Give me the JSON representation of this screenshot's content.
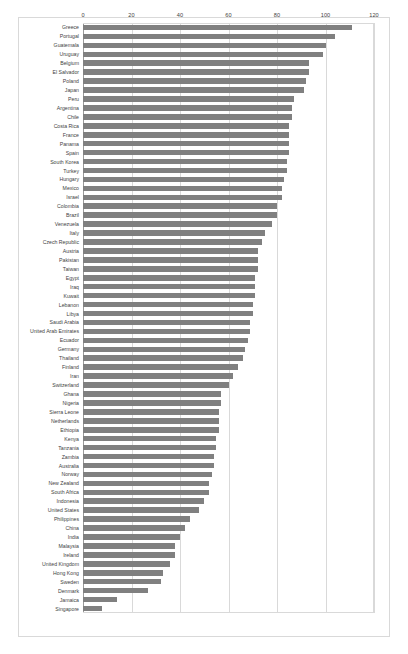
{
  "chart_data": {
    "type": "bar",
    "orientation": "horizontal",
    "title": "",
    "subtitle": "",
    "xlabel": "",
    "ylabel": "",
    "xlim": [
      0,
      120
    ],
    "ylim": null,
    "grid": true,
    "gridline_axis": "x",
    "legend": null,
    "legend_position": "none",
    "bar_color": "#808080",
    "axis_tick_labels": [
      "0",
      "20",
      "40",
      "60",
      "80",
      "100",
      "120"
    ],
    "axis_ticks": [
      0,
      20,
      40,
      60,
      80,
      100,
      120
    ],
    "categories": [
      "Greece",
      "Portugal",
      "Guatemala",
      "Uruguay",
      "Belgium",
      "El Salvador",
      "Poland",
      "Japan",
      "Peru",
      "Argentina",
      "Chile",
      "Costa Rica",
      "France",
      "Panama",
      "Spain",
      "South Korea",
      "Turkey",
      "Hungary",
      "Mexico",
      "Israel",
      "Colombia",
      "Brazil",
      "Venezuela",
      "Italy",
      "Czech Republic",
      "Austria",
      "Pakistan",
      "Taiwan",
      "Egypt",
      "Iraq",
      "Kuwait",
      "Lebanon",
      "Libya",
      "Saudi Arabia",
      "United Arab Emirates",
      "Ecuador",
      "Germany",
      "Thailand",
      "Finland",
      "Iran",
      "Switzerland",
      "Ghana",
      "Nigeria",
      "Sierra Leone",
      "Netherlands",
      "Ethiopia",
      "Kenya",
      "Tanzania",
      "Zambia",
      "Australia",
      "Norway",
      "New Zealand",
      "South Africa",
      "Indonesia",
      "United States",
      "Philippines",
      "China",
      "India",
      "Malaysia",
      "Ireland",
      "United Kingdom",
      "Hong Kong",
      "Sweden",
      "Denmark",
      "Jamaica",
      "Singapore"
    ],
    "values": [
      111,
      104,
      100,
      99,
      93,
      93,
      92,
      91,
      87,
      86,
      86,
      85,
      85,
      85,
      85,
      84,
      84,
      83,
      82,
      82,
      80,
      80,
      78,
      75,
      74,
      72,
      72,
      72,
      71,
      71,
      71,
      70,
      70,
      69,
      69,
      68,
      67,
      66,
      64,
      62,
      60,
      57,
      57,
      56,
      56,
      56,
      55,
      55,
      54,
      54,
      53,
      52,
      52,
      50,
      48,
      44,
      42,
      40,
      38,
      38,
      36,
      33,
      32,
      27,
      14,
      8
    ]
  }
}
